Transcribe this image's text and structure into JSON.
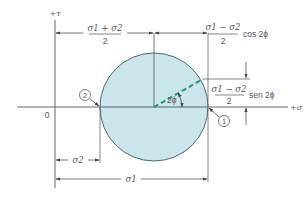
{
  "diagram": {
    "colors": {
      "line": "#555555",
      "circle_fill": "#cbe6ea",
      "circle_stroke": "#4a6a70",
      "radius_dash": "#1f9a75",
      "background": "#ffffff"
    },
    "axes": {
      "tau_label": "+τ",
      "sigma_label": "+σ",
      "origin_label": "0"
    },
    "points": {
      "point1_label": "1",
      "point2_label": "2"
    },
    "dimensions": {
      "center_numerator": "σ1 + σ2",
      "center_denominator": "2",
      "cos_numerator": "σ1 − σ2",
      "cos_denominator": "2",
      "cos_suffix": "cos 2ϕ",
      "sen_numerator": "σ1 − σ2",
      "sen_denominator": "2",
      "sen_suffix": "sen 2ϕ",
      "sigma2_label": "σ2",
      "sigma1_label": "σ1",
      "angle_label": "2ϕ"
    }
  }
}
